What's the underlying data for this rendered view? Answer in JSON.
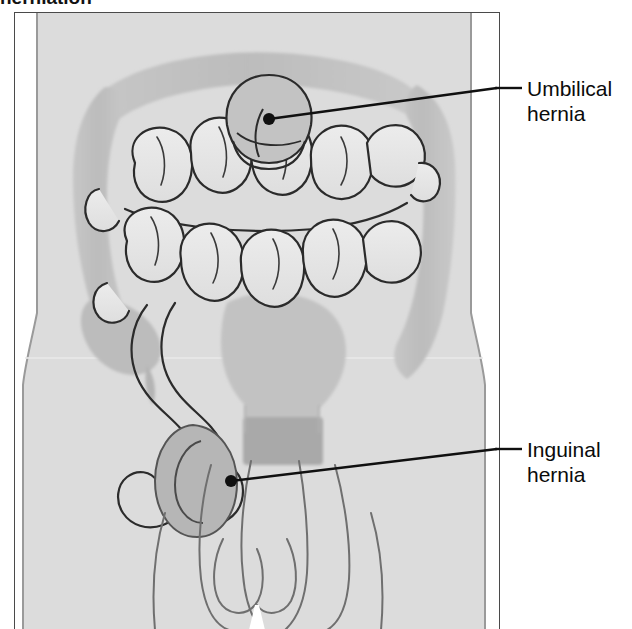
{
  "caption": {
    "text": "herniation"
  },
  "figure": {
    "frame": {
      "x": 14,
      "y": 12,
      "width": 486,
      "height": 617
    },
    "background_color": "#ffffff",
    "body_fill": "#dcdcdc",
    "body_outline": "#8c8c8c",
    "colon_fill": "#bdbdbd",
    "colon_edge": "#a8a8a8",
    "small_intestine_fill": "#e4e4e4",
    "small_intestine_outline": "#2b2b2b",
    "rectum_fill": "#b0b0b0",
    "hernia_sac_fill": "#b8b8b8",
    "leader_color": "#101010",
    "dot_color": "#101010"
  },
  "callouts": [
    {
      "id": "umbilical",
      "label_line1": "Umbilical",
      "label_line2": "hernia",
      "dot": {
        "x": 269,
        "y": 119
      },
      "elbow": {
        "x": 497,
        "y": 88
      },
      "end": {
        "x": 522,
        "y": 88
      }
    },
    {
      "id": "inguinal",
      "label_line1": "Inguinal",
      "label_line2": "hernia",
      "dot": {
        "x": 231,
        "y": 481
      },
      "elbow": {
        "x": 497,
        "y": 449
      },
      "end": {
        "x": 522,
        "y": 449
      }
    }
  ]
}
